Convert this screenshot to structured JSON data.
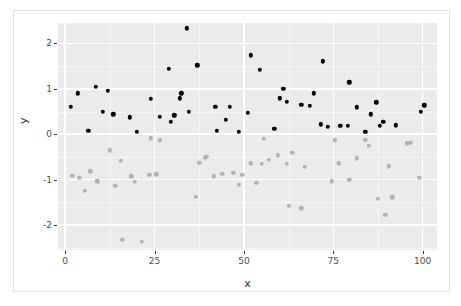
{
  "figure": {
    "background_color": "#ffffff",
    "panel_background_color": "#ebebeb",
    "grid_color": "#ffffff",
    "frame_color": "#e2e2e2"
  },
  "chart_data": {
    "type": "scatter",
    "title": "",
    "xlabel": "x",
    "ylabel": "y",
    "xlim": [
      -2,
      104
    ],
    "ylim": [
      -2.55,
      2.45
    ],
    "xticks": [
      0,
      25,
      50,
      75,
      100
    ],
    "yticks": [
      2,
      1,
      0,
      -1,
      -2
    ],
    "xtick_labels": [
      "0",
      "25",
      "50",
      "75",
      "100"
    ],
    "ytick_labels": [
      "2",
      "1",
      "0",
      "-1",
      "-2"
    ],
    "grid": true,
    "minor_grid": true,
    "legend": null,
    "point_size": 4.4,
    "series": [
      {
        "name": "group-black",
        "color": "#000000",
        "points": [
          [
            1.5,
            0.6
          ],
          [
            3.5,
            0.9
          ],
          [
            6.5,
            0.07
          ],
          [
            8.5,
            1.05
          ],
          [
            10.5,
            0.49
          ],
          [
            12.0,
            0.96
          ],
          [
            13.5,
            0.44
          ],
          [
            18.0,
            0.37
          ],
          [
            20.0,
            0.05
          ],
          [
            24.0,
            0.78
          ],
          [
            26.5,
            0.39
          ],
          [
            29.0,
            1.44
          ],
          [
            29.5,
            0.27
          ],
          [
            30.5,
            0.42
          ],
          [
            32.0,
            0.79
          ],
          [
            32.5,
            0.9
          ],
          [
            34.0,
            2.33
          ],
          [
            34.5,
            0.5
          ],
          [
            37.0,
            1.52
          ],
          [
            42.0,
            0.61
          ],
          [
            42.5,
            0.07
          ],
          [
            45.0,
            0.32
          ],
          [
            46.0,
            0.6
          ],
          [
            48.5,
            0.05
          ],
          [
            51.0,
            0.47
          ],
          [
            52.0,
            1.74
          ],
          [
            54.5,
            1.42
          ],
          [
            58.5,
            0.12
          ],
          [
            60.0,
            0.79
          ],
          [
            61.0,
            1.0
          ],
          [
            62.0,
            0.71
          ],
          [
            66.0,
            0.65
          ],
          [
            68.5,
            0.62
          ],
          [
            69.5,
            0.9
          ],
          [
            71.5,
            0.22
          ],
          [
            72.0,
            1.61
          ],
          [
            73.5,
            0.16
          ],
          [
            77.0,
            0.18
          ],
          [
            79.0,
            0.18
          ],
          [
            79.5,
            1.14
          ],
          [
            81.5,
            0.59
          ],
          [
            84.0,
            0.06
          ],
          [
            85.5,
            0.44
          ],
          [
            87.0,
            0.7
          ],
          [
            88.0,
            0.19
          ],
          [
            89.0,
            0.27
          ],
          [
            92.5,
            0.2
          ],
          [
            99.5,
            0.5
          ],
          [
            100.5,
            0.64
          ]
        ]
      },
      {
        "name": "group-gray",
        "color": "#b3b3b3",
        "points": [
          [
            2.0,
            -0.91
          ],
          [
            4.0,
            -0.96
          ],
          [
            5.5,
            -1.24
          ],
          [
            7.0,
            -0.82
          ],
          [
            9.0,
            -1.04
          ],
          [
            12.5,
            -0.35
          ],
          [
            14.0,
            -1.14
          ],
          [
            15.5,
            -0.59
          ],
          [
            16.0,
            -2.33
          ],
          [
            18.5,
            -0.93
          ],
          [
            19.5,
            -1.05
          ],
          [
            21.5,
            -2.37
          ],
          [
            23.5,
            -0.9
          ],
          [
            24.0,
            -0.09
          ],
          [
            25.5,
            -0.88
          ],
          [
            26.5,
            -0.13
          ],
          [
            36.5,
            -1.38
          ],
          [
            37.5,
            -0.63
          ],
          [
            39.0,
            -0.52
          ],
          [
            39.5,
            -0.5
          ],
          [
            41.5,
            -0.93
          ],
          [
            44.0,
            -0.87
          ],
          [
            47.0,
            -0.85
          ],
          [
            48.5,
            -1.12
          ],
          [
            49.5,
            -0.89
          ],
          [
            52.0,
            -0.64
          ],
          [
            53.5,
            -1.07
          ],
          [
            55.0,
            -0.65
          ],
          [
            55.5,
            -0.1
          ],
          [
            57.0,
            -0.57
          ],
          [
            59.5,
            -0.46
          ],
          [
            62.0,
            -0.65
          ],
          [
            62.5,
            -1.57
          ],
          [
            63.5,
            -0.41
          ],
          [
            66.0,
            -1.63
          ],
          [
            67.0,
            -0.72
          ],
          [
            74.5,
            -1.04
          ],
          [
            75.5,
            -0.13
          ],
          [
            76.5,
            -0.64
          ],
          [
            79.5,
            -1.0
          ],
          [
            81.5,
            -0.53
          ],
          [
            84.0,
            -0.12
          ],
          [
            85.0,
            -0.25
          ],
          [
            87.5,
            -1.42
          ],
          [
            89.5,
            -1.78
          ],
          [
            90.5,
            -0.71
          ],
          [
            91.5,
            -1.39
          ],
          [
            95.5,
            -0.2
          ],
          [
            96.5,
            -0.19
          ],
          [
            99.0,
            -0.96
          ]
        ]
      }
    ]
  }
}
